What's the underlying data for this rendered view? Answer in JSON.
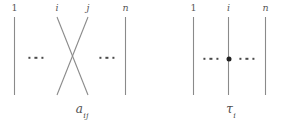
{
  "figure": {
    "background_color": "#ffffff",
    "strand_color": "#8a8a8a",
    "dot_color": "#4a4a4a",
    "node_color": "#222222",
    "label_color": "#575757"
  },
  "diagrams": [
    {
      "id": "a-ij",
      "name": "crossing-diagram",
      "caption_base": "a",
      "caption_sub": "ij",
      "caption_full": "a_ij",
      "top_labels": [
        {
          "text": "1",
          "italic": false
        },
        {
          "text": "i",
          "italic": true
        },
        {
          "text": "j",
          "italic": true
        },
        {
          "text": "n",
          "italic": true
        }
      ],
      "ellipsis_left": "...",
      "ellipsis_right": "...",
      "strands": [
        {
          "name": "strand-1",
          "type": "vertical"
        },
        {
          "name": "strand-i",
          "type": "crossing"
        },
        {
          "name": "strand-j",
          "type": "crossing"
        },
        {
          "name": "strand-n",
          "type": "vertical"
        }
      ]
    },
    {
      "id": "tau-i",
      "name": "marked-point-diagram",
      "caption_base": "τ",
      "caption_sub": "i",
      "caption_full": "τ_i",
      "top_labels": [
        {
          "text": "1",
          "italic": false
        },
        {
          "text": "i",
          "italic": true
        },
        {
          "text": "n",
          "italic": true
        }
      ],
      "ellipsis_left": "...",
      "ellipsis_right": "...",
      "strands": [
        {
          "name": "strand-1",
          "type": "vertical"
        },
        {
          "name": "strand-i",
          "type": "vertical-marked"
        },
        {
          "name": "strand-n",
          "type": "vertical"
        }
      ],
      "marked_point": true
    }
  ]
}
